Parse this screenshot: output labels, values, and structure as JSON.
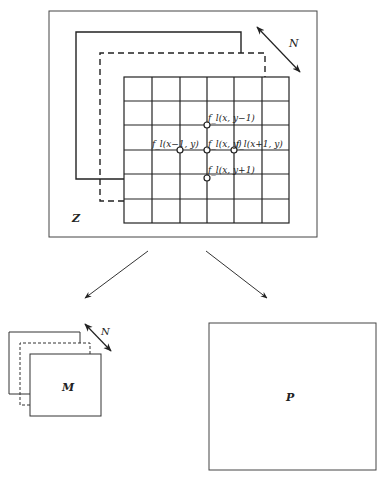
{
  "colors": {
    "stroke": "#222222",
    "background": "#ffffff"
  },
  "top_panel": {
    "volume_label": "Z",
    "depth_label": "N",
    "grid": {
      "columns": 6,
      "rows": 6
    },
    "neighbors": {
      "center": "f_l(x, y)",
      "top": "f_l(x, y−1)",
      "left": "f_l(x−1, y)",
      "right": "f_l(x+1, y)",
      "bottom": "f_l(x, y+1)"
    }
  },
  "left_output": {
    "label": "M",
    "depth_label": "N"
  },
  "right_output": {
    "label": "P"
  }
}
